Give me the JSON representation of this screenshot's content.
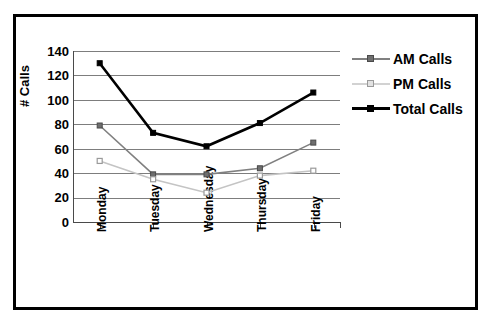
{
  "chart_data": {
    "type": "line",
    "title": "",
    "xlabel": "",
    "ylabel": "# Calls",
    "categories": [
      "Monday",
      "Tuesday",
      "Wednesday",
      "Thursday",
      "Friday"
    ],
    "yticks": [
      0,
      20,
      40,
      60,
      80,
      100,
      120,
      140
    ],
    "ylim": [
      0,
      140
    ],
    "grid": "horizontal",
    "legend_position": "right",
    "series": [
      {
        "name": "AM Calls",
        "values": [
          79,
          39,
          39,
          44,
          65
        ],
        "color": "#808080",
        "marker": "filled-square"
      },
      {
        "name": "PM Calls",
        "values": [
          50,
          35,
          24,
          38,
          42
        ],
        "color": "#c4c4c4",
        "marker": "open-square"
      },
      {
        "name": "Total Calls",
        "values": [
          130,
          73,
          62,
          81,
          106
        ],
        "color": "#000000",
        "marker": "filled-square"
      }
    ]
  },
  "axes": {
    "y_title": "# Calls",
    "y_tick_labels": [
      "0",
      "20",
      "40",
      "60",
      "80",
      "100",
      "120",
      "140"
    ],
    "x_tick_labels": [
      "Monday",
      "Tuesday",
      "Wednesday",
      "Thursday",
      "Friday"
    ]
  },
  "legend": {
    "entries": [
      {
        "label": "AM Calls"
      },
      {
        "label": "PM Calls"
      },
      {
        "label": "Total Calls"
      }
    ]
  },
  "colors": {
    "frame": "#000000",
    "gridline": "#7d7d7d",
    "am": "#808080",
    "pm": "#c4c4c4",
    "total": "#000000",
    "background": "#ffffff"
  }
}
